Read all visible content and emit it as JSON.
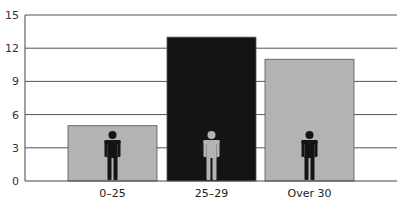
{
  "chart_data": {
    "type": "bar",
    "title": "",
    "xlabel": "",
    "ylabel": "",
    "categories": [
      "0–25",
      "25–29",
      "Over 30"
    ],
    "values": [
      5,
      13,
      11
    ],
    "bar_colors": [
      "#b3b3b3",
      "#141414",
      "#b3b3b3"
    ],
    "icon_colors": [
      "#141414",
      "#b3b3b3",
      "#141414"
    ],
    "icons": [
      "person-icon",
      "person-icon",
      "person-icon"
    ],
    "ylim": [
      0,
      15
    ],
    "yticks": [
      0,
      3,
      6,
      9,
      12,
      15
    ],
    "grid": true,
    "legend": null
  },
  "colors": {
    "gridline": "#555555",
    "axis": "#444444",
    "background": "#ffffff"
  }
}
